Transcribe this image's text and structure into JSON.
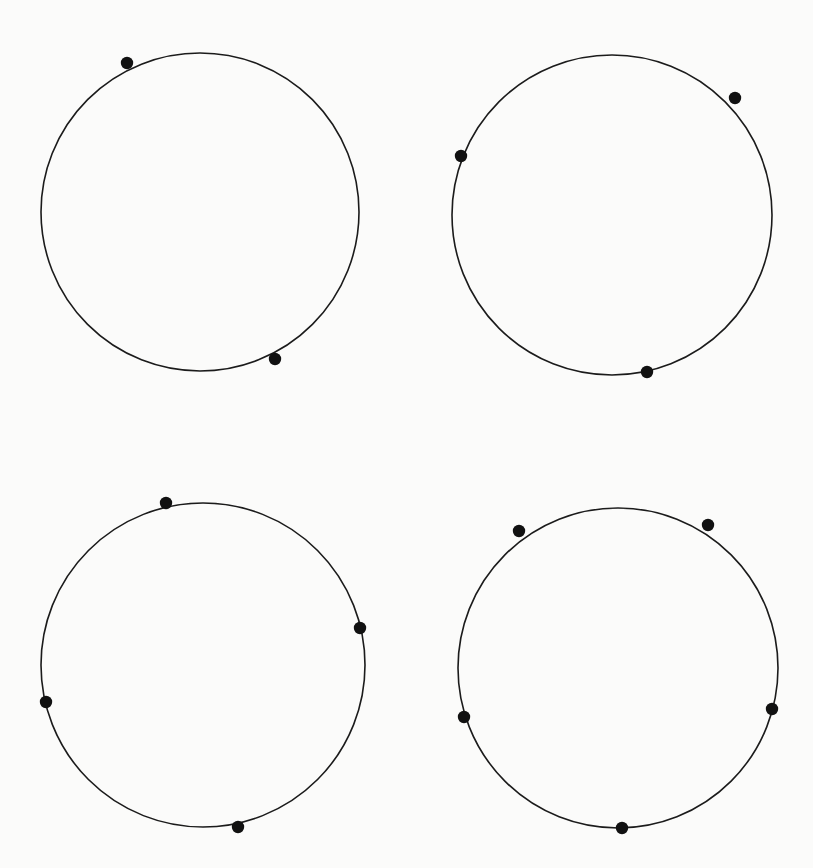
{
  "figure": {
    "background_color": "#fbfbfa",
    "stroke_color": "#1b1b1b",
    "point_color": "#111111",
    "width": 813,
    "height": 868,
    "layout": "2x2 grid of circles",
    "title": "",
    "caption": ""
  },
  "chart_data": {
    "type": "scatter",
    "title": "",
    "subtitle": "",
    "xlabel": "",
    "ylabel": "",
    "grid": false,
    "legend": null,
    "axis_visible": false,
    "tick_labels": [],
    "annotations": [],
    "xlim": [
      0,
      813
    ],
    "ylim": [
      0,
      868
    ],
    "panels": [
      {
        "id": "panel-1",
        "position": "top-left",
        "label": "",
        "point_count": 2,
        "circle": {
          "cx": 200,
          "cy": 212,
          "r": 159
        },
        "points": [
          {
            "x": 127,
            "y": 63,
            "angle_deg": 110
          },
          {
            "x": 275,
            "y": 359,
            "angle_deg": -68
          }
        ]
      },
      {
        "id": "panel-2",
        "position": "top-right",
        "label": "",
        "point_count": 3,
        "circle": {
          "cx": 612,
          "cy": 215,
          "r": 160
        },
        "points": [
          {
            "x": 461,
            "y": 156,
            "angle_deg": 158
          },
          {
            "x": 735,
            "y": 98,
            "angle_deg": 47
          },
          {
            "x": 647,
            "y": 372,
            "angle_deg": -77
          }
        ]
      },
      {
        "id": "panel-3",
        "position": "bottom-left",
        "label": "",
        "point_count": 4,
        "circle": {
          "cx": 203,
          "cy": 665,
          "r": 162
        },
        "points": [
          {
            "x": 166,
            "y": 503,
            "angle_deg": 103
          },
          {
            "x": 360,
            "y": 628,
            "angle_deg": 13
          },
          {
            "x": 46,
            "y": 702,
            "angle_deg": -166
          },
          {
            "x": 238,
            "y": 827,
            "angle_deg": -78
          }
        ]
      },
      {
        "id": "panel-4",
        "position": "bottom-right",
        "label": "",
        "point_count": 5,
        "circle": {
          "cx": 618,
          "cy": 668,
          "r": 160
        },
        "points": [
          {
            "x": 519,
            "y": 531,
            "angle_deg": 126
          },
          {
            "x": 708,
            "y": 525,
            "angle_deg": 63
          },
          {
            "x": 464,
            "y": 717,
            "angle_deg": -162
          },
          {
            "x": 772,
            "y": 709,
            "angle_deg": -15
          },
          {
            "x": 622,
            "y": 828,
            "angle_deg": -89
          }
        ]
      }
    ],
    "point_radius": 6.2,
    "point_counts": [
      2,
      3,
      4,
      5
    ]
  }
}
